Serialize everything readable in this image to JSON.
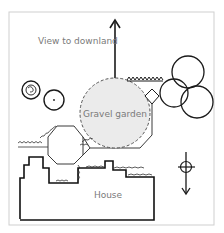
{
  "diagram": {
    "type": "garden-plan",
    "labels": {
      "view": "View to downland",
      "gravel": "Gravel garden",
      "house": "House"
    },
    "colors": {
      "background": "#ffffff",
      "frame": "#cfcfcf",
      "ink": "#1a1a1a",
      "gravel_fill": "#ebebeb",
      "label_text": "#7a7a7a"
    },
    "elements": [
      {
        "id": "view-arrow",
        "kind": "arrow",
        "direction": "up"
      },
      {
        "id": "gravel-garden",
        "kind": "dashed-circle"
      },
      {
        "id": "trees-left",
        "kind": "circles",
        "count": 2
      },
      {
        "id": "trees-right",
        "kind": "circles",
        "count": 3
      },
      {
        "id": "hedge",
        "kind": "zigzag"
      },
      {
        "id": "octagon-terrace",
        "kind": "octagon"
      },
      {
        "id": "house",
        "kind": "outline"
      },
      {
        "id": "north-compass",
        "kind": "compass",
        "direction": "down"
      }
    ]
  }
}
